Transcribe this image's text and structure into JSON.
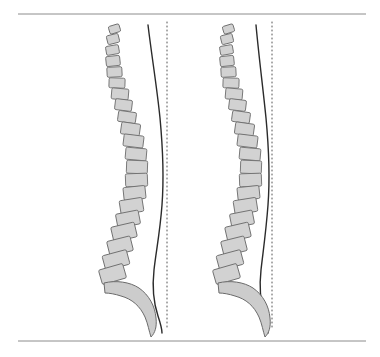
{
  "figure": {
    "background_color": "#ffffff",
    "width": 380,
    "height": 357,
    "rules": [
      {
        "name": "top-rule",
        "y": 14,
        "x1": 18,
        "x2": 366,
        "color": "#8c8c8c",
        "thickness": 1
      },
      {
        "name": "bottom-rule",
        "y": 341,
        "x1": 18,
        "x2": 366,
        "color": "#8c8c8c",
        "thickness": 1
      }
    ],
    "style": {
      "vertebra_fill": "#d2d2d2",
      "vertebra_stroke": "#6f6f6f",
      "sacrum_fill": "#cccccc",
      "sacrum_stroke": "#6b6b6b",
      "contour_stroke": "#2b2b2b",
      "plumb_stroke": "#555555",
      "plumb_dash": "1,3"
    },
    "panels": [
      {
        "id": "left-spine",
        "label": "Left sagittal spine diagram",
        "plumb_line": {
          "x": 167,
          "y1": 22,
          "y2": 330
        },
        "contour_path": "M148,25 C152,58 157,88 160,118 C163,150 164,178 162,205 C160,232 156,252 154,270 C152,288 154,304 158,316 C161,325 162,330 162,333",
        "vertebrae": [
          {
            "cx": 114.5,
            "cy": 29,
            "w": 11,
            "h": 8,
            "rot": -17
          },
          {
            "cx": 113.0,
            "cy": 39,
            "w": 12,
            "h": 9,
            "rot": -14
          },
          {
            "cx": 112.5,
            "cy": 50,
            "w": 13,
            "h": 9,
            "rot": -10
          },
          {
            "cx": 113.0,
            "cy": 61,
            "w": 14,
            "h": 10,
            "rot": -6
          },
          {
            "cx": 114.5,
            "cy": 72,
            "w": 15,
            "h": 10,
            "rot": -3
          },
          {
            "cx": 117.0,
            "cy": 83,
            "w": 16,
            "h": 10,
            "rot": 2
          },
          {
            "cx": 120.0,
            "cy": 94,
            "w": 17,
            "h": 11,
            "rot": 5
          },
          {
            "cx": 123.5,
            "cy": 105,
            "w": 17,
            "h": 11,
            "rot": 7
          },
          {
            "cx": 127.0,
            "cy": 117,
            "w": 18,
            "h": 11,
            "rot": 8
          },
          {
            "cx": 130.5,
            "cy": 129,
            "w": 19,
            "h": 12,
            "rot": 8
          },
          {
            "cx": 133.5,
            "cy": 141,
            "w": 20,
            "h": 12,
            "rot": 7
          },
          {
            "cx": 136.0,
            "cy": 154,
            "w": 21,
            "h": 12,
            "rot": 5
          },
          {
            "cx": 137.0,
            "cy": 167,
            "w": 21,
            "h": 13,
            "rot": 2
          },
          {
            "cx": 136.5,
            "cy": 180,
            "w": 22,
            "h": 13,
            "rot": -2
          },
          {
            "cx": 134.5,
            "cy": 193,
            "w": 22,
            "h": 13,
            "rot": -6
          },
          {
            "cx": 131.5,
            "cy": 206,
            "w": 23,
            "h": 14,
            "rot": -9
          },
          {
            "cx": 128.0,
            "cy": 219,
            "w": 23,
            "h": 14,
            "rot": -11
          },
          {
            "cx": 124.0,
            "cy": 232,
            "w": 24,
            "h": 15,
            "rot": -13
          },
          {
            "cx": 120.0,
            "cy": 246,
            "w": 24,
            "h": 15,
            "rot": -14
          },
          {
            "cx": 116.0,
            "cy": 260,
            "w": 25,
            "h": 15,
            "rot": -15
          },
          {
            "cx": 112.5,
            "cy": 274,
            "w": 25,
            "h": 15,
            "rot": -16
          }
        ],
        "sacrum_path": "M104,283 C116,280 130,282 139,288 C149,295 155,306 156,318 C157,327 155,333 151,337 C149,331 148,324 145,317 C140,306 132,299 121,296 C115,294 109,293 105,293 Z"
      },
      {
        "id": "right-spine",
        "label": "Right sagittal spine diagram",
        "plumb_line": {
          "x": 272,
          "y1": 22,
          "y2": 330
        },
        "contour_path": "M256,25 C259,58 263,88 266,118 C269,150 270,178 268,205 C266,232 263,252 261,270 C259,288 261,304 264,316 C267,325 268,330 268,333",
        "vertebrae": [
          {
            "cx": 228.5,
            "cy": 29,
            "w": 11,
            "h": 8,
            "rot": -17
          },
          {
            "cx": 227.0,
            "cy": 39,
            "w": 12,
            "h": 9,
            "rot": -14
          },
          {
            "cx": 226.5,
            "cy": 50,
            "w": 13,
            "h": 9,
            "rot": -10
          },
          {
            "cx": 227.0,
            "cy": 61,
            "w": 14,
            "h": 10,
            "rot": -6
          },
          {
            "cx": 228.5,
            "cy": 72,
            "w": 15,
            "h": 10,
            "rot": -3
          },
          {
            "cx": 231.0,
            "cy": 83,
            "w": 16,
            "h": 10,
            "rot": 2
          },
          {
            "cx": 234.0,
            "cy": 94,
            "w": 17,
            "h": 11,
            "rot": 5
          },
          {
            "cx": 237.5,
            "cy": 105,
            "w": 17,
            "h": 11,
            "rot": 7
          },
          {
            "cx": 241.0,
            "cy": 117,
            "w": 18,
            "h": 11,
            "rot": 8
          },
          {
            "cx": 244.5,
            "cy": 129,
            "w": 19,
            "h": 12,
            "rot": 8
          },
          {
            "cx": 247.5,
            "cy": 141,
            "w": 20,
            "h": 12,
            "rot": 7
          },
          {
            "cx": 250.0,
            "cy": 154,
            "w": 21,
            "h": 12,
            "rot": 5
          },
          {
            "cx": 251.0,
            "cy": 167,
            "w": 21,
            "h": 13,
            "rot": 2
          },
          {
            "cx": 250.5,
            "cy": 180,
            "w": 22,
            "h": 13,
            "rot": -2
          },
          {
            "cx": 248.5,
            "cy": 193,
            "w": 22,
            "h": 13,
            "rot": -6
          },
          {
            "cx": 245.5,
            "cy": 206,
            "w": 23,
            "h": 14,
            "rot": -9
          },
          {
            "cx": 242.0,
            "cy": 219,
            "w": 23,
            "h": 14,
            "rot": -11
          },
          {
            "cx": 238.0,
            "cy": 232,
            "w": 24,
            "h": 15,
            "rot": -13
          },
          {
            "cx": 234.0,
            "cy": 246,
            "w": 24,
            "h": 15,
            "rot": -14
          },
          {
            "cx": 230.0,
            "cy": 260,
            "w": 25,
            "h": 15,
            "rot": -15
          },
          {
            "cx": 226.5,
            "cy": 274,
            "w": 25,
            "h": 15,
            "rot": -16
          }
        ],
        "sacrum_path": "M218,283 C230,280 244,282 253,288 C263,295 269,306 270,318 C271,327 269,333 265,337 C263,331 262,324 259,317 C254,306 246,299 235,296 C229,294 223,293 219,293 Z"
      }
    ]
  }
}
